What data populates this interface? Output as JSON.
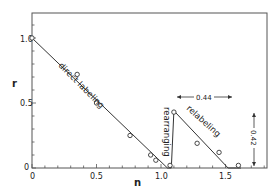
{
  "chart_data": {
    "type": "line",
    "title": "",
    "xlabel": "n",
    "ylabel": "r",
    "xlim": [
      0,
      1.82
    ],
    "ylim": [
      0,
      1.2
    ],
    "x_ticks": [
      "0",
      "0.5",
      "1.0",
      "1.5"
    ],
    "y_ticks": [
      "0",
      "0.5",
      "1.0"
    ],
    "grid": false,
    "series": [
      {
        "name": "fitted line",
        "style": "line",
        "x": [
          0,
          1.05,
          1.08,
          1.1,
          1.52,
          1.62
        ],
        "y": [
          1.0,
          0.0,
          0.0,
          0.44,
          0.0,
          0.0
        ]
      },
      {
        "name": "data points",
        "style": "open-circle",
        "x": [
          0,
          0.35,
          0.5,
          0.76,
          0.92,
          0.96,
          1.07,
          1.1,
          1.28,
          1.45,
          1.6
        ],
        "y": [
          1.0,
          0.72,
          0.5,
          0.25,
          0.1,
          0.06,
          0.02,
          0.43,
          0.19,
          0.12,
          0.02
        ]
      }
    ],
    "annotations": [
      {
        "text": "direct labeling",
        "x": 0.45,
        "y": 0.62,
        "rotation": -45
      },
      {
        "text": "rearranging",
        "x": 1.06,
        "y": 0.22,
        "rotation": 90
      },
      {
        "text": "relabeling",
        "x": 1.3,
        "y": 0.3,
        "rotation": 45
      },
      {
        "text": "0.44",
        "type": "horizontal-dimension",
        "from": 1.1,
        "to": 1.54,
        "y": 0.55
      },
      {
        "text": "0.42",
        "type": "vertical-dimension",
        "x": 1.72,
        "from": 0.0,
        "to": 0.42
      }
    ]
  },
  "labels": {
    "xlabel": "n",
    "ylabel": "r",
    "x_ticks": [
      "0",
      "0.5",
      "1.0",
      "1.5"
    ],
    "y_ticks": [
      "0",
      "0.5",
      "1.0"
    ],
    "direct": "direct labeling",
    "rearranging": "rearranging",
    "relabeling": "relabeling",
    "dim_h": "0.44",
    "dim_v": "0.42"
  }
}
